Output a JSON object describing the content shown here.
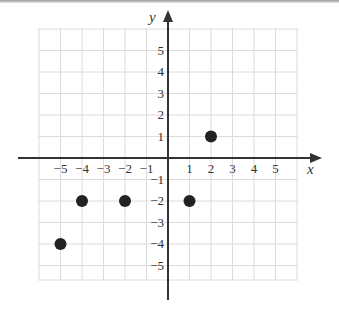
{
  "chart_data": {
    "type": "scatter",
    "title": "",
    "xlabel": "x",
    "ylabel": "y",
    "xlim": [
      -6,
      6
    ],
    "ylim": [
      -6,
      6
    ],
    "grid": true,
    "x_ticks": [
      -5,
      -4,
      -3,
      -2,
      -1,
      1,
      2,
      3,
      4,
      5
    ],
    "y_ticks": [
      5,
      4,
      3,
      2,
      1,
      -1,
      -2,
      -3,
      -4,
      -5
    ],
    "x_tick_labels": [
      "−5",
      "−4",
      "−3",
      "−2",
      "−1",
      "1",
      "2",
      "3",
      "4",
      "5"
    ],
    "y_tick_labels": [
      "5",
      "4",
      "3",
      "2",
      "1",
      "−1",
      "−2",
      "−3",
      "−4",
      "−5"
    ],
    "points": [
      {
        "x": -5,
        "y": -4
      },
      {
        "x": -4,
        "y": -2
      },
      {
        "x": -2,
        "y": -2
      },
      {
        "x": 1,
        "y": -2
      },
      {
        "x": 2,
        "y": 1
      }
    ],
    "legend": null
  },
  "colors": {
    "axis": "#333333",
    "grid": "#dcdcdc",
    "point": "#222222"
  },
  "layout": {
    "origin_px": [
      168,
      158
    ],
    "unit_px": 21.5,
    "grid_px": {
      "left": 38,
      "right": 298,
      "top": 28,
      "bottom": 280
    }
  }
}
